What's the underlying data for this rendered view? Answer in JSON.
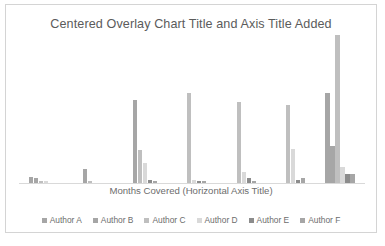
{
  "chart_data": {
    "type": "bar",
    "title": "Centered Overlay Chart Title and Axis Title Added",
    "xlabel": "Months Covered (Horizontal Axis Title)",
    "ylabel": "",
    "grid": false,
    "legend_position": "bottom",
    "ylim": [
      0,
      100
    ],
    "categories": [
      "1",
      "2",
      "3",
      "4",
      "5",
      "6",
      "7"
    ],
    "series": [
      {
        "name": "Author A",
        "color": "#a6a6a6",
        "values": [
          4,
          0,
          0,
          0,
          0,
          0,
          58
        ]
      },
      {
        "name": "Author B",
        "color": "#a6a6a6",
        "values": [
          3,
          9,
          53,
          0,
          0,
          0,
          24
        ]
      },
      {
        "name": "Author C",
        "color": "#bfbfbf",
        "values": [
          1,
          1,
          21,
          58,
          52,
          50,
          95
        ]
      },
      {
        "name": "Author D",
        "color": "#d9d9d9",
        "values": [
          1,
          0,
          13,
          2,
          7,
          22,
          10
        ]
      },
      {
        "name": "Author E",
        "color": "#8c8c8c",
        "values": [
          0,
          0,
          2,
          1,
          3,
          2,
          6
        ]
      },
      {
        "name": "Author F",
        "color": "#a6a6a6",
        "values": [
          0,
          0,
          1,
          1,
          1,
          3,
          6
        ]
      }
    ]
  },
  "legend": {
    "items": [
      {
        "label": "Author A"
      },
      {
        "label": "Author B"
      },
      {
        "label": "Author C"
      },
      {
        "label": "Author D"
      },
      {
        "label": "Author E"
      },
      {
        "label": "Author F"
      }
    ]
  }
}
